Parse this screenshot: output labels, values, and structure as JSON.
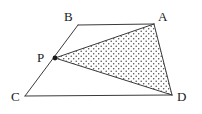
{
  "figure": {
    "type": "geometry-diagram",
    "background_color": "#ffffff",
    "stroke_color": "#3a3a3a",
    "label_color": "#1a1a1a",
    "stipple_dot_color": "#4a4a4a",
    "stroke_width": 1,
    "points": {
      "A": {
        "label": "A",
        "x": 154,
        "y": 24,
        "label_x": 158,
        "label_y": 10
      },
      "B": {
        "label": "B",
        "x": 78,
        "y": 25,
        "label_x": 64,
        "label_y": 10
      },
      "C": {
        "label": "C",
        "x": 25,
        "y": 96,
        "label_x": 11,
        "label_y": 90
      },
      "D": {
        "label": "D",
        "x": 172,
        "y": 95,
        "label_x": 177,
        "label_y": 90
      },
      "P": {
        "label": "P",
        "x": 55,
        "y": 58,
        "label_x": 37,
        "label_y": 51,
        "marker": "filled-dot",
        "marker_radius": 2.4
      }
    },
    "segments": [
      {
        "name": "segment-BA",
        "from": "B",
        "to": "A"
      },
      {
        "name": "segment-AD",
        "from": "A",
        "to": "D"
      },
      {
        "name": "segment-DC",
        "from": "D",
        "to": "C"
      },
      {
        "name": "segment-CB",
        "from": "C",
        "to": "B"
      },
      {
        "name": "segment-PA",
        "from": "P",
        "to": "A"
      },
      {
        "name": "segment-PD",
        "from": "P",
        "to": "D"
      }
    ],
    "shaded_region": {
      "name": "triangle-PAD",
      "vertices": [
        "P",
        "A",
        "D"
      ],
      "fill": "stipple-dots"
    }
  }
}
